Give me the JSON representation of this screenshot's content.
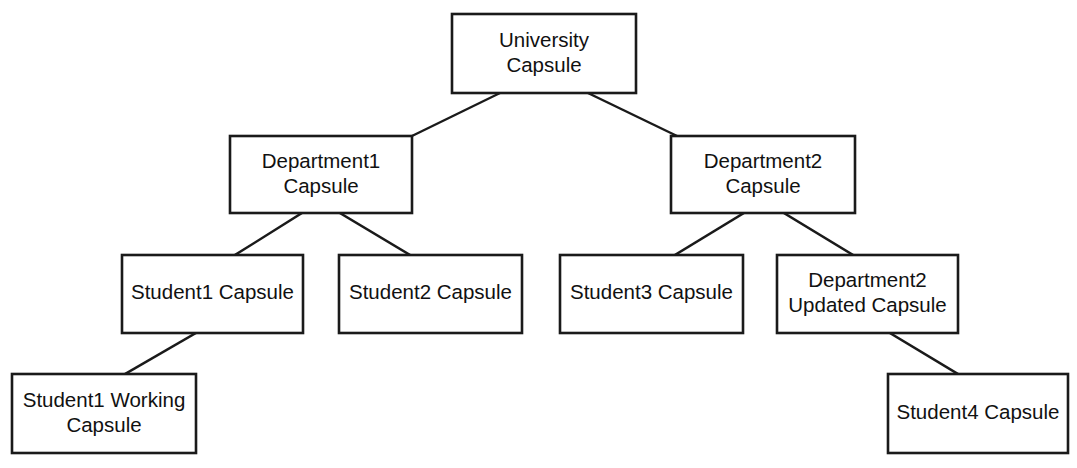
{
  "diagram": {
    "type": "tree",
    "background_color": "#ffffff",
    "line_color": "#1a1a1a",
    "text_color": "#111111",
    "nodes": [
      {
        "id": "university",
        "label_line1": "University",
        "label_line2": "Capsule",
        "x": 452,
        "y": 14,
        "w": 184,
        "h": 79,
        "level": 1
      },
      {
        "id": "department1",
        "label_line1": "Department1",
        "label_line2": "Capsule",
        "x": 230,
        "y": 136,
        "w": 182,
        "h": 77,
        "level": 2
      },
      {
        "id": "department2",
        "label_line1": "Department2",
        "label_line2": "Capsule",
        "x": 671,
        "y": 136,
        "w": 184,
        "h": 77,
        "level": 2
      },
      {
        "id": "student1",
        "label_line1": "Student1 Capsule",
        "label_line2": "",
        "x": 122,
        "y": 255,
        "w": 181,
        "h": 78,
        "level": 3
      },
      {
        "id": "student2",
        "label_line1": "Student2 Capsule",
        "label_line2": "",
        "x": 339,
        "y": 255,
        "w": 183,
        "h": 78,
        "level": 3
      },
      {
        "id": "student3",
        "label_line1": "Student3 Capsule",
        "label_line2": "",
        "x": 560,
        "y": 255,
        "w": 183,
        "h": 78,
        "level": 3
      },
      {
        "id": "department2updated",
        "label_line1": "Department2",
        "label_line2": "Updated Capsule",
        "x": 777,
        "y": 255,
        "w": 181,
        "h": 78,
        "level": 3
      },
      {
        "id": "student1working",
        "label_line1": "Student1 Working",
        "label_line2": "Capsule",
        "x": 12,
        "y": 374,
        "w": 184,
        "h": 79,
        "level": 4
      },
      {
        "id": "student4",
        "label_line1": "Student4 Capsule",
        "label_line2": "",
        "x": 888,
        "y": 374,
        "w": 180,
        "h": 79,
        "level": 4
      }
    ],
    "edges": [
      {
        "id": "edge-university-department1",
        "from": "university",
        "to": "department1",
        "x1": 500,
        "y1": 93,
        "x2": 412,
        "y2": 136
      },
      {
        "id": "edge-university-department2",
        "from": "university",
        "to": "department2",
        "x1": 588,
        "y1": 93,
        "x2": 677,
        "y2": 136
      },
      {
        "id": "edge-department1-student1",
        "from": "department1",
        "to": "student1",
        "x1": 302,
        "y1": 213,
        "x2": 235,
        "y2": 255
      },
      {
        "id": "edge-department1-student2",
        "from": "department1",
        "to": "student2",
        "x1": 340,
        "y1": 213,
        "x2": 410,
        "y2": 255
      },
      {
        "id": "edge-department2-student3",
        "from": "department2",
        "to": "student3",
        "x1": 744,
        "y1": 213,
        "x2": 675,
        "y2": 255
      },
      {
        "id": "edge-department2-department2updated",
        "from": "department2",
        "to": "department2updated",
        "x1": 784,
        "y1": 213,
        "x2": 853,
        "y2": 255
      },
      {
        "id": "edge-student1-student1working",
        "from": "student1",
        "to": "student1working",
        "x1": 196,
        "y1": 333,
        "x2": 125,
        "y2": 374
      },
      {
        "id": "edge-department2updated-student4",
        "from": "department2updated",
        "to": "student4",
        "x1": 890,
        "y1": 333,
        "x2": 958,
        "y2": 374
      }
    ]
  }
}
